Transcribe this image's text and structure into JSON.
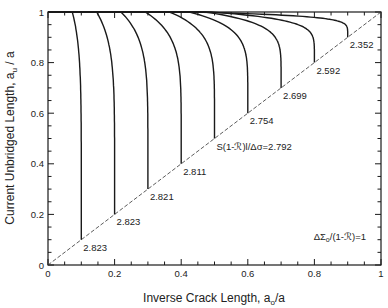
{
  "chart_data": {
    "type": "line",
    "title": "",
    "xlabel": "Inverse Crack Length,  a",
    "xlabel_sub": "o",
    "xlabel_suffix": "/a",
    "ylabel": "Current Unbridged Length,  a",
    "ylabel_sub": "u",
    "ylabel_suffix": " / a",
    "xlim": [
      0,
      1
    ],
    "ylim": [
      0,
      1
    ],
    "x_ticks": [
      0,
      0.2,
      0.4,
      0.6,
      0.8,
      1
    ],
    "x_tick_labels": [
      "0",
      "0.2",
      "0.4",
      "0.6",
      "0.8",
      "1"
    ],
    "y_ticks": [
      0,
      0.2,
      0.4,
      0.6,
      0.8,
      1
    ],
    "y_tick_labels": [
      "0",
      "0.2",
      "0.4",
      "0.6",
      "0.8",
      "1"
    ],
    "minor_tick_step": 0.05,
    "grid": false,
    "reference_line": {
      "style": "dashed",
      "from": [
        0,
        0
      ],
      "to": [
        1,
        1
      ],
      "meaning": "a_u/a = a_o/a"
    },
    "series": [
      {
        "name": "x0=0.1",
        "end": [
          0.1,
          0.1
        ],
        "label": "2.823",
        "knee": 0.02
      },
      {
        "name": "x0=0.2",
        "end": [
          0.2,
          0.2
        ],
        "label": "2.823",
        "knee": 0.04
      },
      {
        "name": "x0=0.3",
        "end": [
          0.3,
          0.3
        ],
        "label": "2.821",
        "knee": 0.06
      },
      {
        "name": "x0=0.4",
        "end": [
          0.4,
          0.4
        ],
        "label": "2.811",
        "knee": 0.08
      },
      {
        "name": "x0=0.5",
        "end": [
          0.5,
          0.5
        ],
        "label": "S(1-ℛ)l/Δσ=2.792",
        "knee": 0.1
      },
      {
        "name": "x0=0.6",
        "end": [
          0.6,
          0.6
        ],
        "label": "2.754",
        "knee": 0.13
      },
      {
        "name": "x0=0.7",
        "end": [
          0.7,
          0.7
        ],
        "label": "2.699",
        "knee": 0.17
      },
      {
        "name": "x0=0.8",
        "end": [
          0.8,
          0.8
        ],
        "label": "2.592",
        "knee": 0.23
      },
      {
        "name": "x0=0.9",
        "end": [
          0.9,
          0.9
        ],
        "label": "2.352",
        "knee": 0.35
      }
    ],
    "annotations": [
      {
        "text": "ΔΣ",
        "sub": "o",
        "suffix": "/(1-ℛ)=1",
        "x": 0.78,
        "y": 0.1
      }
    ],
    "legend": null
  },
  "colors": {
    "line": "#1a1a1a",
    "axis": "#1a1a1a",
    "text": "#222222"
  }
}
